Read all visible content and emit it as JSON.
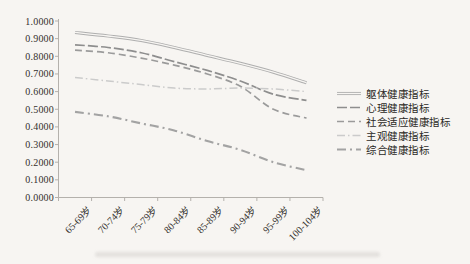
{
  "figure": {
    "background": "#f7f5f2",
    "axis_color": "#b4b1ac",
    "text_color": "#33302c"
  },
  "chart_data": {
    "type": "line",
    "title": "",
    "xlabel": "",
    "ylabel": "",
    "ylim": [
      0.0,
      1.0
    ],
    "grid": false,
    "legend_position": "right",
    "y_tick_labels": [
      "1.0000",
      "0.9000",
      "0.8000",
      "0.7000",
      "0.6000",
      "0.5000",
      "0.4000",
      "0.3000",
      "0.2000",
      "0.1000",
      "0.0000"
    ],
    "categories": [
      "65-69岁",
      "70-74岁",
      "75-79岁",
      "80-84岁",
      "85-89岁",
      "90-94岁",
      "95-99岁",
      "100-104岁"
    ],
    "series": [
      {
        "name": "躯体健康指标",
        "color": "#aeaeae",
        "style": "double",
        "values": [
          0.935,
          0.915,
          0.89,
          0.85,
          0.805,
          0.76,
          0.71,
          0.65
        ]
      },
      {
        "name": "心理健康指标",
        "color": "#8e8e8e",
        "style": "long-dash",
        "values": [
          0.865,
          0.85,
          0.82,
          0.77,
          0.72,
          0.66,
          0.585,
          0.55
        ]
      },
      {
        "name": "社会适应健康指标",
        "color": "#9b9b9b",
        "style": "dash",
        "values": [
          0.835,
          0.82,
          0.79,
          0.75,
          0.7,
          0.63,
          0.5,
          0.45
        ]
      },
      {
        "name": "主观健康指标",
        "color": "#cbcbcb",
        "style": "dash-dot",
        "values": [
          0.68,
          0.66,
          0.64,
          0.62,
          0.615,
          0.62,
          0.615,
          0.6
        ]
      },
      {
        "name": "综合健康指标",
        "color": "#a3a3a3",
        "style": "dash-dot-bold",
        "values": [
          0.485,
          0.46,
          0.42,
          0.38,
          0.32,
          0.27,
          0.2,
          0.155
        ]
      }
    ]
  }
}
